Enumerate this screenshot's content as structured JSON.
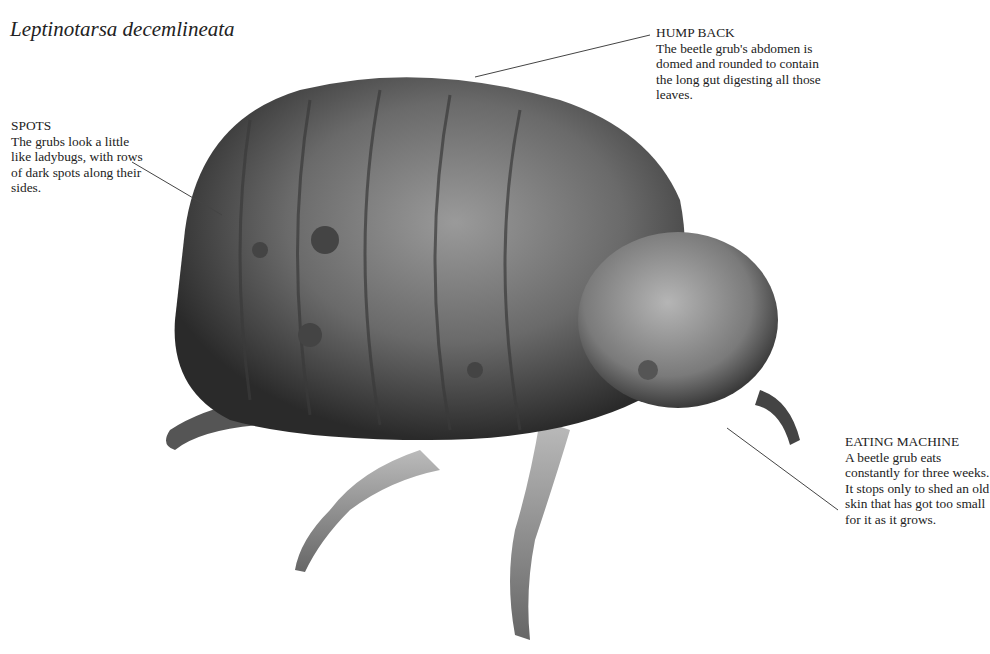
{
  "title": "Leptinotarsa decemlineata",
  "callouts": {
    "hump_back": {
      "heading": "HUMP BACK",
      "body": "The beetle grub's abdomen is domed and rounded to contain the long gut digesting all those leaves."
    },
    "spots": {
      "heading": "SPOTS",
      "body": "The grubs look a little like ladybugs, with rows of dark spots along their sides."
    },
    "eating_machine": {
      "heading": "EATING MACHINE",
      "body": "A beetle grub eats constantly for three weeks. It stops only to shed an old skin that has got too small for it as it grows."
    }
  },
  "colors": {
    "background": "#ffffff",
    "text": "#222222",
    "leader_line": "#444444"
  }
}
